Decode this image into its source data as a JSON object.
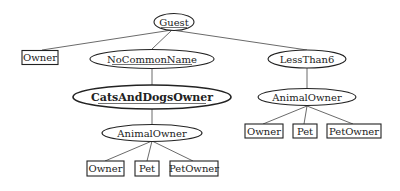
{
  "diagram": {
    "type": "tree",
    "nodes": {
      "guest": {
        "label": "Guest",
        "shape": "ellipse",
        "underlined": true
      },
      "owner_top": {
        "label": "Owner",
        "shape": "box"
      },
      "no_common_name": {
        "label": "NoCommonName",
        "shape": "ellipse",
        "underlined": true
      },
      "less_than_6": {
        "label": "LessThan6",
        "shape": "ellipse"
      },
      "cats_and_dogs_owner": {
        "label": "CatsAndDogsOwner",
        "shape": "ellipse",
        "bold": true,
        "underlined": true
      },
      "animal_owner_left": {
        "label": "AnimalOwner",
        "shape": "ellipse"
      },
      "animal_owner_right": {
        "label": "AnimalOwner",
        "shape": "ellipse"
      },
      "owner_left": {
        "label": "Owner",
        "shape": "box"
      },
      "pet_left": {
        "label": "Pet",
        "shape": "box"
      },
      "pet_owner_left": {
        "label": "PetOwner",
        "shape": "box"
      },
      "owner_right": {
        "label": "Owner",
        "shape": "box"
      },
      "pet_right": {
        "label": "Pet",
        "shape": "box"
      },
      "pet_owner_right": {
        "label": "PetOwner",
        "shape": "box"
      }
    },
    "edges": [
      [
        "guest",
        "owner_top"
      ],
      [
        "guest",
        "no_common_name"
      ],
      [
        "guest",
        "less_than_6"
      ],
      [
        "no_common_name",
        "cats_and_dogs_owner"
      ],
      [
        "cats_and_dogs_owner",
        "animal_owner_left"
      ],
      [
        "animal_owner_left",
        "owner_left"
      ],
      [
        "animal_owner_left",
        "pet_left"
      ],
      [
        "animal_owner_left",
        "pet_owner_left"
      ],
      [
        "less_than_6",
        "animal_owner_right"
      ],
      [
        "animal_owner_right",
        "owner_right"
      ],
      [
        "animal_owner_right",
        "pet_right"
      ],
      [
        "animal_owner_right",
        "pet_owner_right"
      ]
    ]
  }
}
